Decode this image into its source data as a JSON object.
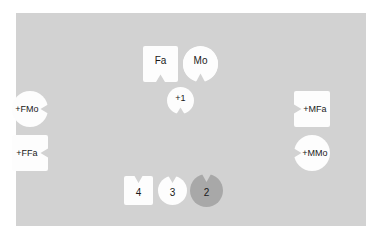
{
  "diagram": {
    "panel": {
      "background_color": "#d2d2d2",
      "page_background_color": "#ffffff"
    },
    "colors": {
      "node_fill_light": "#fdfdfd",
      "node_fill_gray": "#a8a8a8",
      "text": "#1a1a1a"
    },
    "nodes": [
      {
        "id": "fa",
        "label": "Fa",
        "shape": "square",
        "notch": "bottom",
        "fill": "#fdfdfd"
      },
      {
        "id": "mo",
        "label": "Mo",
        "shape": "circle",
        "notch": "bottom",
        "fill": "#fdfdfd"
      },
      {
        "id": "plus1",
        "label": "+1",
        "shape": "circle",
        "notch": "bottom",
        "fill": "#fdfdfd"
      },
      {
        "id": "plus-f-mo",
        "label": "+FMo",
        "shape": "circle",
        "notch": "right",
        "fill": "#fdfdfd"
      },
      {
        "id": "plus-f-fa",
        "label": "+FFa",
        "shape": "square",
        "notch": "right",
        "fill": "#fdfdfd"
      },
      {
        "id": "plus-m-fa",
        "label": "+MFa",
        "shape": "square",
        "notch": "left",
        "fill": "#fdfdfd"
      },
      {
        "id": "plus-m-mo",
        "label": "+MMo",
        "shape": "circle",
        "notch": "left",
        "fill": "#fdfdfd"
      },
      {
        "id": "node-4",
        "label": "4",
        "shape": "square",
        "notch": "top",
        "fill": "#fdfdfd"
      },
      {
        "id": "node-3",
        "label": "3",
        "shape": "circle",
        "notch": "top",
        "fill": "#fdfdfd"
      },
      {
        "id": "node-2",
        "label": "2",
        "shape": "circle",
        "notch": "top",
        "fill": "#a8a8a8"
      }
    ]
  }
}
